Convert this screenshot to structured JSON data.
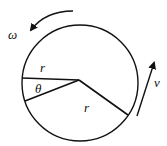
{
  "diagram": {
    "labels": {
      "omega": "ω",
      "radius_top": "r",
      "theta": "θ",
      "radius_lower": "r",
      "velocity": "v"
    },
    "colors": {
      "stroke": "#111111",
      "background": "#ffffff"
    }
  }
}
